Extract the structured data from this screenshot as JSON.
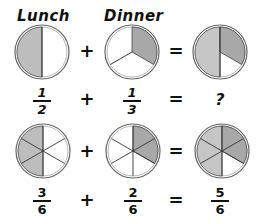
{
  "headings": {
    "lunch": "Lunch",
    "dinner": "Dinner"
  },
  "colors": {
    "shaded": "#bdbdbd",
    "shaded_dark": "#a8a8a8",
    "unshaded": "#ffffff",
    "outline": "#555555"
  },
  "row1": {
    "pies": [
      {
        "name": "lunch-half-pie",
        "slices": 2,
        "shaded": 1,
        "label": "1/2"
      },
      {
        "name": "dinner-third-pie",
        "slices": 3,
        "shaded": 1,
        "label": "1/3"
      },
      {
        "name": "result-unknown-pie",
        "slices": "1/2 + 1/3",
        "label": "?"
      }
    ],
    "fractions": [
      {
        "num": "1",
        "den": "2"
      },
      {
        "num": "1",
        "den": "3"
      }
    ],
    "operators": {
      "plus": "+",
      "equals": "="
    },
    "result": "?"
  },
  "row2": {
    "pies": [
      {
        "name": "three-sixths-pie",
        "slices": 6,
        "shaded": 3,
        "label": "3/6"
      },
      {
        "name": "two-sixths-pie",
        "slices": 6,
        "shaded": 2,
        "label": "2/6"
      },
      {
        "name": "five-sixths-pie",
        "slices": 6,
        "shaded": 5,
        "label": "5/6"
      }
    ],
    "fractions": [
      {
        "num": "3",
        "den": "6"
      },
      {
        "num": "2",
        "den": "6"
      },
      {
        "num": "5",
        "den": "6"
      }
    ],
    "operators": {
      "plus": "+",
      "equals": "="
    }
  }
}
